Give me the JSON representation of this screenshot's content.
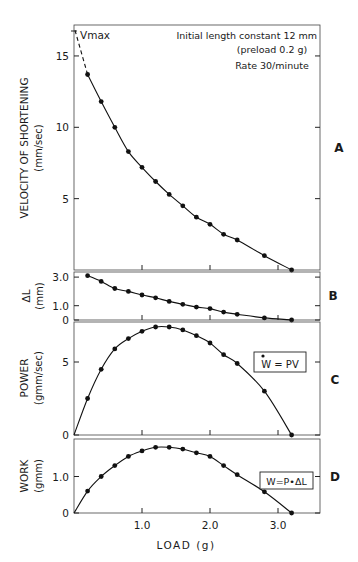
{
  "chart_data": [
    {
      "panel": "A",
      "type": "line",
      "ylabel": "VELOCITY OF SHORTENING",
      "yunits": "(mm/sec)",
      "xlabel": "LOAD (g)",
      "ylim": [
        0,
        17
      ],
      "yticks": [
        5,
        10,
        15
      ],
      "ytick_labels": [
        "5",
        "10",
        "15"
      ],
      "annotations": [
        "Vmax",
        "Initial length constant 12 mm",
        "(preload 0.2 g)",
        "Rate 30/minute"
      ],
      "vmax": 16.8,
      "x": [
        0.2,
        0.4,
        0.6,
        0.8,
        1.0,
        1.2,
        1.4,
        1.6,
        1.8,
        2.0,
        2.2,
        2.4,
        2.8,
        3.2
      ],
      "values": [
        13.7,
        11.8,
        10.0,
        8.3,
        7.2,
        6.2,
        5.3,
        4.5,
        3.7,
        3.2,
        2.5,
        2.1,
        1.0,
        0.0
      ]
    },
    {
      "panel": "B",
      "type": "line",
      "ylabel": "ΔL",
      "yunits": "(mm)",
      "ylim": [
        0,
        3.3
      ],
      "yticks": [
        0,
        1.0,
        3.0
      ],
      "ytick_labels": [
        "0",
        "1.0",
        "3.0"
      ],
      "x": [
        0.2,
        0.4,
        0.6,
        0.8,
        1.0,
        1.2,
        1.4,
        1.6,
        1.8,
        2.0,
        2.2,
        2.4,
        2.8,
        3.2
      ],
      "values": [
        3.1,
        2.7,
        2.2,
        2.0,
        1.75,
        1.55,
        1.3,
        1.1,
        0.9,
        0.8,
        0.55,
        0.4,
        0.15,
        0.0
      ]
    },
    {
      "panel": "C",
      "type": "line",
      "ylabel": "POWER",
      "yunits": "(gmm/sec)",
      "ylim": [
        0,
        7.9
      ],
      "yticks": [
        0,
        5
      ],
      "ytick_labels": [
        "0",
        "5"
      ],
      "legend": "W = PV",
      "x": [
        0,
        0.2,
        0.4,
        0.6,
        0.8,
        1.0,
        1.2,
        1.4,
        1.6,
        1.8,
        2.0,
        2.2,
        2.4,
        2.8,
        3.2
      ],
      "values": [
        0,
        2.5,
        4.5,
        5.9,
        6.6,
        7.1,
        7.4,
        7.4,
        7.2,
        6.8,
        6.3,
        5.5,
        4.9,
        3.0,
        0.0
      ]
    },
    {
      "panel": "D",
      "type": "line",
      "ylabel": "WORK",
      "yunits": "(gmm)",
      "xlabel": "LOAD (g)",
      "ylim": [
        0,
        2.0
      ],
      "yticks": [
        0,
        1.0
      ],
      "ytick_labels": [
        "0",
        "1.0"
      ],
      "legend": "W=P•ΔL",
      "x": [
        0,
        0.2,
        0.4,
        0.6,
        0.8,
        1.0,
        1.2,
        1.4,
        1.6,
        1.8,
        2.0,
        2.2,
        2.4,
        2.8,
        3.2
      ],
      "values": [
        0,
        0.6,
        1.0,
        1.3,
        1.55,
        1.7,
        1.8,
        1.8,
        1.75,
        1.65,
        1.55,
        1.3,
        1.05,
        0.58,
        0.0
      ],
      "xticks": [
        1.0,
        2.0,
        3.0
      ],
      "xtick_labels": [
        "1.0",
        "2.0",
        "3.0"
      ],
      "xlim": [
        0,
        3.6
      ]
    }
  ],
  "labels": {
    "panel_a": "A",
    "panel_b": "B",
    "panel_c": "C",
    "panel_d": "D",
    "vmax": "Vmax",
    "note_line1": "Initial length constant 12 mm",
    "note_line2": "(preload 0.2 g)",
    "note_line3": "Rate 30/minute",
    "ylabel_a": "VELOCITY OF SHORTENING",
    "yunits_a": "(mm/sec)",
    "ylabel_b": "ΔL",
    "yunits_b": "(mm)",
    "ylabel_c": "POWER",
    "yunits_c": "(gmm/sec)",
    "ylabel_d": "WORK",
    "yunits_d": "(gmm)",
    "legend_c": "W = PV",
    "legend_d": "W=P•ΔL",
    "xlabel": "LOAD (g)"
  }
}
